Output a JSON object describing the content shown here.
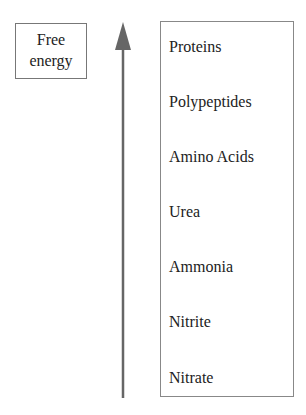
{
  "axis_label": {
    "line1": "Free",
    "line2": "energy"
  },
  "arrow": {
    "direction": "up",
    "color": "#666666"
  },
  "compounds": [
    {
      "label": "Proteins",
      "top": 16
    },
    {
      "label": "Polypeptides",
      "top": 71
    },
    {
      "label": "Amino Acids",
      "top": 126
    },
    {
      "label": "Urea",
      "top": 181
    },
    {
      "label": "Ammonia",
      "top": 236
    },
    {
      "label": "Nitrite",
      "top": 291
    },
    {
      "label": "Nitrate",
      "top": 347
    }
  ]
}
